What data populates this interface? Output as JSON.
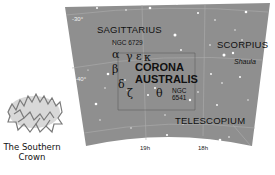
{
  "map": {
    "background_color": "#8f8f8f",
    "star_color": "#ffffff",
    "gridline_color": "#b0b0b0",
    "constellations": [
      {
        "name": "SAGITTARIUS"
      },
      {
        "name": "SCORPIUS"
      },
      {
        "name": "TELESCOPIUM"
      }
    ],
    "main_constellation": {
      "line1": "CORONA",
      "line2": "AUSTRALIS"
    },
    "objects": [
      {
        "label": "NGC 6729"
      },
      {
        "label_line1": "NGC",
        "label_line2": "6541"
      },
      {
        "label": "Shaula"
      }
    ],
    "greek_letters": {
      "alpha": "α",
      "beta": "β",
      "gamma": "γ",
      "epsilon": "ε",
      "kappa": "κ",
      "delta": "δ",
      "zeta": "ζ",
      "theta": "θ"
    },
    "declination_labels": [
      "-30°",
      "-40°"
    ],
    "ra_labels": [
      "19h",
      "18h"
    ]
  },
  "illustration": {
    "caption_line1": "The Southern",
    "caption_line2": "Crown"
  }
}
